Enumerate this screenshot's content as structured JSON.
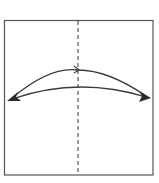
{
  "diagram": {
    "type": "origami-fold-instruction",
    "paper": {
      "x": 4,
      "y": 20,
      "width": 149,
      "height": 155,
      "stroke": "#555555",
      "fill": "#ffffff"
    },
    "fold_line": {
      "style": "dashed",
      "orientation": "vertical",
      "x": 78,
      "color": "#333333"
    },
    "arrows": [
      {
        "name": "fold-arrow",
        "kind": "curved",
        "from": "left",
        "to": "right",
        "color": "#3a3a3a"
      },
      {
        "name": "unfold-arrow",
        "kind": "curved",
        "from": "center",
        "to": "both-edges",
        "color": "#3a3a3a"
      }
    ],
    "colors": {
      "line": "#3a3a3a",
      "border": "#555555",
      "background": "#ffffff"
    }
  }
}
